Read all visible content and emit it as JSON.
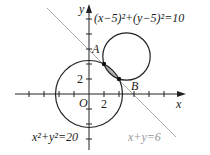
{
  "figure": {
    "axes": {
      "x_label": "x",
      "y_label": "y",
      "origin_label": "O",
      "x_tick_label": "2",
      "y_tick_label": "2",
      "unit_px": 7.5,
      "origin_px": [
        89,
        94
      ]
    },
    "circles": [
      {
        "equation": "x²+y²=20",
        "center": [
          0,
          0
        ],
        "radius_sq": 20
      },
      {
        "equation": "(x−5)²+(y−5)²=10",
        "center": [
          5,
          5
        ],
        "radius_sq": 10
      }
    ],
    "line": {
      "equation": "x+y=6",
      "color": "#aaaaaa"
    },
    "points": [
      {
        "label": "A",
        "coords": [
          0,
          6
        ]
      },
      {
        "label": "B",
        "coords": [
          6,
          0
        ]
      }
    ],
    "intersections": [
      [
        2,
        4
      ],
      [
        4,
        2
      ]
    ],
    "labels": {
      "circle1": "x²+y²=20",
      "circle2": "(x−5)²+(y−5)²=10",
      "line": "x+y=6",
      "A": "A",
      "B": "B",
      "O": "O",
      "x": "x",
      "y": "y",
      "two_x": "2",
      "two_y": "2"
    }
  }
}
